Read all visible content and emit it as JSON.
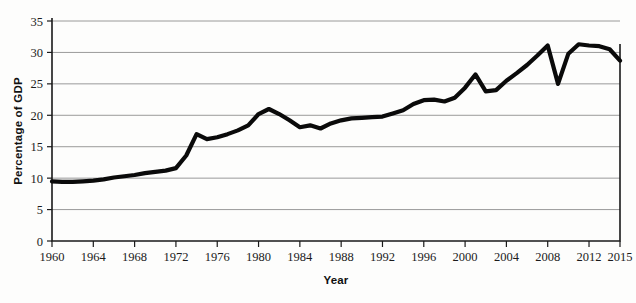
{
  "chart_data": {
    "type": "line",
    "title": "",
    "xlabel": "Year",
    "ylabel": "Percentage of GDP",
    "xlim": [
      1960,
      2015
    ],
    "ylim": [
      0,
      35
    ],
    "grid": true,
    "legend": "none",
    "x_ticks": [
      "1960",
      "1964",
      "1968",
      "1972",
      "1976",
      "1980",
      "1984",
      "1988",
      "1992",
      "1996",
      "2000",
      "2004",
      "2008",
      "2012",
      "2015"
    ],
    "y_ticks": [
      "0",
      "5",
      "10",
      "15",
      "20",
      "25",
      "30",
      "35"
    ],
    "line_color": "#0a0a0a",
    "x": [
      1960,
      1961,
      1962,
      1963,
      1964,
      1965,
      1966,
      1967,
      1968,
      1969,
      1970,
      1971,
      1972,
      1973,
      1974,
      1975,
      1976,
      1977,
      1978,
      1979,
      1980,
      1981,
      1982,
      1983,
      1984,
      1985,
      1986,
      1987,
      1988,
      1989,
      1990,
      1991,
      1992,
      1993,
      1994,
      1995,
      1996,
      1997,
      1998,
      1999,
      2000,
      2001,
      2002,
      2003,
      2004,
      2005,
      2006,
      2007,
      2008,
      2009,
      2010,
      2011,
      2012,
      2013,
      2014,
      2015
    ],
    "values": [
      9.5,
      9.4,
      9.4,
      9.5,
      9.6,
      9.8,
      10.1,
      10.3,
      10.5,
      10.8,
      11.0,
      11.2,
      11.6,
      13.6,
      17.0,
      16.2,
      16.5,
      17.0,
      17.6,
      18.4,
      20.2,
      21.0,
      20.2,
      19.2,
      18.1,
      18.4,
      17.9,
      18.7,
      19.2,
      19.5,
      19.6,
      19.7,
      19.8,
      20.3,
      20.8,
      21.8,
      22.4,
      22.5,
      22.2,
      22.8,
      24.4,
      26.5,
      23.8,
      24.0,
      25.5,
      26.7,
      28.0,
      29.5,
      31.1,
      25.0,
      29.8,
      31.3,
      31.1,
      31.0,
      30.5,
      28.7
    ]
  }
}
